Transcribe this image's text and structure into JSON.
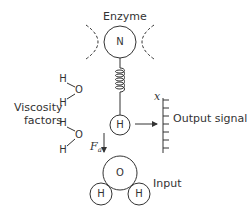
{
  "diagram": {
    "enzyme_label": "Enzyme",
    "enzyme_atom": "N",
    "viscosity_label_line1": "Viscosity",
    "viscosity_label_line2": "factors",
    "water_molecules": [
      {
        "h_top": "H",
        "o": "O",
        "h_bottom": "H"
      },
      {
        "h_top": "H",
        "o": "O",
        "h_bottom": "H"
      }
    ],
    "sensor_atom": "H",
    "output_label": "Output signal",
    "scale_label": "x",
    "force_label": "F",
    "force_subscript": "a",
    "input_label": "Input",
    "input_molecule": {
      "o": "O",
      "h_left": "H",
      "h_right": "H"
    },
    "colors": {
      "stroke": "#333333",
      "background": "#ffffff"
    }
  }
}
